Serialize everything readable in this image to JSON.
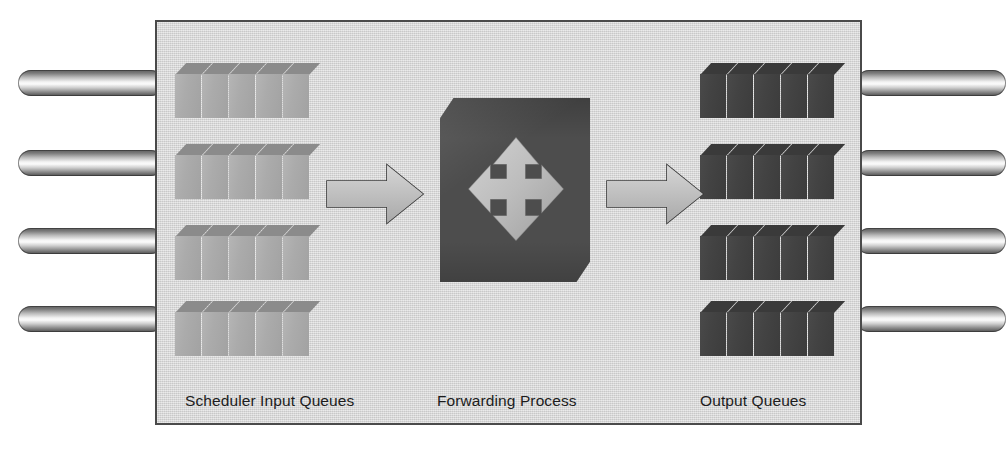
{
  "diagram": {
    "panel": {
      "fill_color": "#d9d9d9",
      "border_color": "#4a4a4a"
    },
    "captions": [
      {
        "id": "input-queues",
        "label": "Scheduler Input Queues",
        "x": 185,
        "y": 392
      },
      {
        "id": "forwarding",
        "label": "Forwarding Process",
        "x": 437,
        "y": 392
      },
      {
        "id": "output-queues",
        "label": "Output Queues",
        "x": 700,
        "y": 392
      }
    ],
    "input_queues": {
      "name": "Scheduler Input Queues",
      "rows": 4,
      "boxes_per_row": 5,
      "box_color": "#ababab",
      "box_top_color": "#8b8b8b",
      "row_tops": [
        62,
        143,
        224,
        300
      ],
      "start_x": 175,
      "box_spacing": 27
    },
    "output_queues": {
      "name": "Output Queues",
      "rows": 4,
      "boxes_per_row": 5,
      "box_color": "#434343",
      "box_top_color": "#3a3a3a",
      "row_tops": [
        62,
        143,
        224,
        300
      ],
      "start_x": 700,
      "box_spacing": 27
    },
    "forwarding_process": {
      "name": "Forwarding Process",
      "cube_color": "#4d4d4d",
      "icon": "four-way-move-arrow",
      "icon_color": "#b8b8b8"
    },
    "flow_arrows": [
      {
        "id": "ingress-arrow",
        "direction": "right",
        "x": 325,
        "y": 163,
        "width": 100,
        "height": 62
      },
      {
        "id": "egress-arrow",
        "direction": "right",
        "x": 605,
        "y": 163,
        "width": 100,
        "height": 62
      }
    ],
    "links": {
      "label": "network-links",
      "count_left": 4,
      "count_right": 4,
      "left_tops": [
        70,
        150,
        228,
        306
      ],
      "right_tops": [
        70,
        150,
        228,
        306
      ],
      "pipe_color_highlight": "#fbfbfb",
      "pipe_color_shadow": "#4f4f4f"
    }
  }
}
